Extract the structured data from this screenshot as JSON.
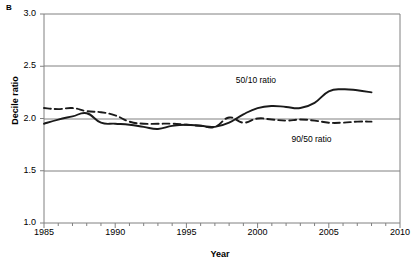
{
  "figure": {
    "panel_letter": "B",
    "xlabel": "Year",
    "ylabel": "Decile ratio"
  },
  "chart_data": {
    "type": "line",
    "title": "",
    "subtitle": "",
    "panel_letter": "B",
    "xlabel": "Year",
    "ylabel": "Decile ratio",
    "xlim": [
      1985,
      2010
    ],
    "ylim": [
      1.0,
      3.0
    ],
    "ytick_labels": [
      "1.0",
      "1.5",
      "2.0",
      "2.5",
      "3.0"
    ],
    "yticks": [
      1.0,
      1.5,
      2.0,
      2.5,
      3.0
    ],
    "xtick_labels": [
      "1985",
      "1990",
      "1995",
      "2000",
      "2005",
      "2010"
    ],
    "xticks": [
      1985,
      1990,
      1995,
      2000,
      2005,
      2010
    ],
    "minor_xtick_interval": 1,
    "grid": "horizontal",
    "legend_position": "inline-annotation",
    "annotations": [
      {
        "text": "50/10 ratio",
        "x": 2000.3,
        "y": 2.36
      },
      {
        "text": "90/50 ratio",
        "x": 2004.2,
        "y": 1.79
      }
    ],
    "x": [
      1985,
      1986,
      1987,
      1988,
      1989,
      1990,
      1991,
      1992,
      1993,
      1994,
      1995,
      1996,
      1997,
      1998,
      1999,
      2000,
      2001,
      2002,
      2003,
      2004,
      2005,
      2006,
      2007,
      2008
    ],
    "series": [
      {
        "name": "50/10 ratio",
        "style": "solid",
        "color": "#1a1a1a",
        "values": [
          1.95,
          1.99,
          2.02,
          2.05,
          1.96,
          1.95,
          1.94,
          1.92,
          1.9,
          1.93,
          1.94,
          1.93,
          1.92,
          1.96,
          2.04,
          2.1,
          2.12,
          2.11,
          2.1,
          2.15,
          2.26,
          2.28,
          2.27,
          2.25
        ]
      },
      {
        "name": "90/50 ratio",
        "style": "dashed",
        "color": "#1a1a1a",
        "values": [
          2.1,
          2.09,
          2.1,
          2.07,
          2.06,
          2.03,
          1.97,
          1.95,
          1.95,
          1.95,
          1.94,
          1.93,
          1.92,
          2.01,
          1.96,
          2.0,
          1.99,
          1.98,
          1.99,
          1.98,
          1.96,
          1.96,
          1.97,
          1.97
        ]
      }
    ]
  }
}
